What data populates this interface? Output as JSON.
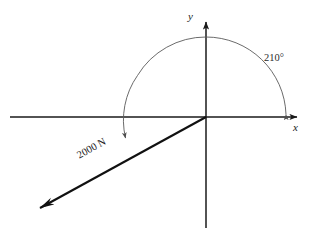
{
  "figure": {
    "type": "vector-diagram",
    "background_color": "#ffffff",
    "axes": {
      "x_label": "x",
      "y_label": "y",
      "axis_color": "#1a1a1a",
      "origin": {
        "x": 206,
        "y": 117
      }
    },
    "angle_arc": {
      "label": "210°",
      "measure_degrees": 210,
      "start_degrees": 0,
      "end_degrees": 210,
      "radius": 78,
      "color": "#5a5a5a",
      "direction": "counter-clockwise",
      "arrowheads": "both-ends"
    },
    "force_vector": {
      "label": "2000 N",
      "magnitude": 2000,
      "unit": "N",
      "direction_degrees": 210,
      "color": "#111111",
      "tail": {
        "x": 206,
        "y": 117
      },
      "tip": {
        "x": 27,
        "y": 215
      }
    }
  }
}
